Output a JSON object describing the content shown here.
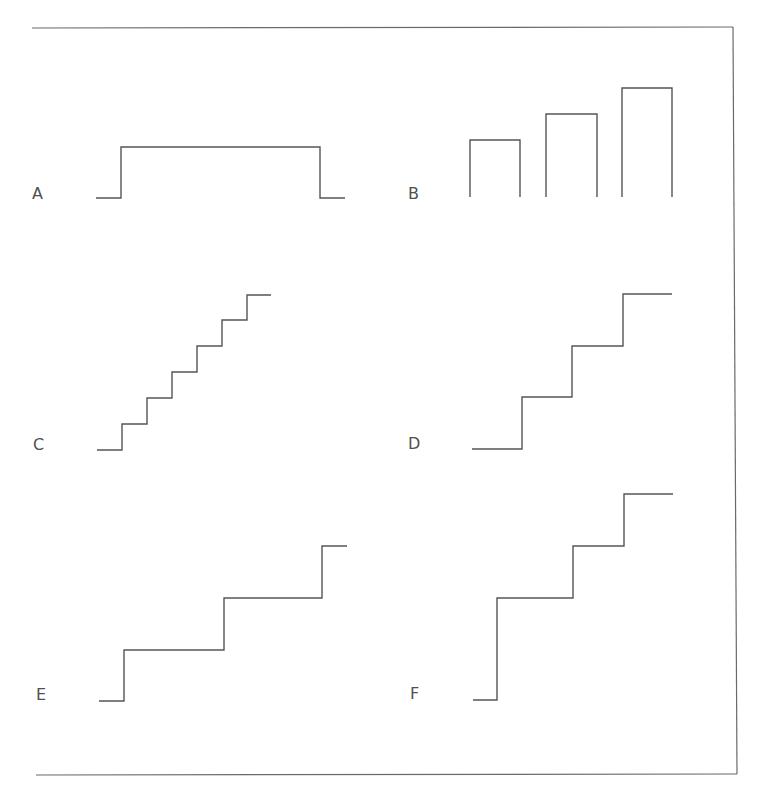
{
  "figure": {
    "frame": {
      "top_line": {
        "x1": 32,
        "y1": 28,
        "x2": 733,
        "y2": 27
      },
      "right_line": {
        "x1": 733,
        "y1": 27,
        "x2": 737,
        "y2": 774
      },
      "bottom_line": {
        "x1": 36,
        "y1": 775,
        "x2": 737,
        "y2": 774
      },
      "stroke_color": "#6a6a6a"
    },
    "stroke_color": "#555555",
    "label_color": "#505050",
    "panels": [
      {
        "id": "A",
        "label": "A",
        "label_pos": {
          "x": 32,
          "y": 186
        },
        "description": "single rectangular pulse",
        "points": [
          [
            96,
            198
          ],
          [
            121,
            198
          ],
          [
            121,
            147
          ],
          [
            320,
            147
          ],
          [
            320,
            198
          ],
          [
            345,
            198
          ]
        ]
      },
      {
        "id": "B",
        "label": "B",
        "label_pos": {
          "x": 408,
          "y": 186
        },
        "description": "three separate pulses of increasing height",
        "bars": [
          {
            "x1": 470,
            "x2": 520,
            "top": 140,
            "bottom": 197
          },
          {
            "x1": 546,
            "x2": 597,
            "top": 114,
            "bottom": 197
          },
          {
            "x1": 622,
            "x2": 672,
            "top": 88,
            "bottom": 197
          }
        ]
      },
      {
        "id": "C",
        "label": "C",
        "label_pos": {
          "x": 33,
          "y": 437
        },
        "description": "staircase with six small steps",
        "points": [
          [
            97,
            450
          ],
          [
            122,
            450
          ],
          [
            122,
            424
          ],
          [
            147,
            424
          ],
          [
            147,
            398
          ],
          [
            172,
            398
          ],
          [
            172,
            372
          ],
          [
            197,
            372
          ],
          [
            197,
            346
          ],
          [
            222,
            346
          ],
          [
            222,
            320
          ],
          [
            247,
            320
          ],
          [
            247,
            295
          ],
          [
            271,
            295
          ]
        ]
      },
      {
        "id": "D",
        "label": "D",
        "label_pos": {
          "x": 408,
          "y": 436
        },
        "description": "staircase with three equal steps",
        "points": [
          [
            472,
            449
          ],
          [
            522,
            449
          ],
          [
            522,
            397
          ],
          [
            572,
            397
          ],
          [
            572,
            346
          ],
          [
            623,
            346
          ],
          [
            623,
            294
          ],
          [
            672,
            294
          ]
        ]
      },
      {
        "id": "E",
        "label": "E",
        "label_pos": {
          "x": 36,
          "y": 687
        },
        "description": "staircase with three wide steps",
        "points": [
          [
            99,
            701
          ],
          [
            124,
            701
          ],
          [
            124,
            650
          ],
          [
            224,
            650
          ],
          [
            224,
            598
          ],
          [
            322,
            598
          ],
          [
            322,
            546
          ],
          [
            347,
            546
          ]
        ]
      },
      {
        "id": "F",
        "label": "F",
        "label_pos": {
          "x": 410,
          "y": 686
        },
        "description": "staircase with one large step followed by two smaller steps",
        "points": [
          [
            473,
            700
          ],
          [
            497,
            700
          ],
          [
            497,
            598
          ],
          [
            573,
            598
          ],
          [
            573,
            546
          ],
          [
            624,
            546
          ],
          [
            624,
            494
          ],
          [
            673,
            494
          ]
        ]
      }
    ]
  }
}
